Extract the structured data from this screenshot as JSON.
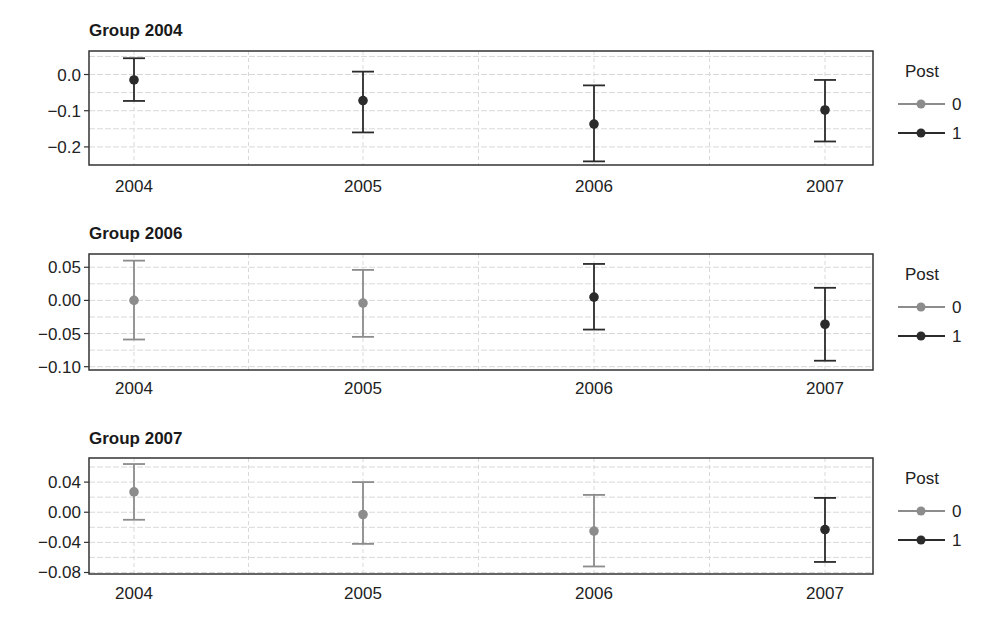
{
  "colors": {
    "post0": "#8c8c8c",
    "post1": "#2b2b2b",
    "frame": "#333333",
    "grid": "#d9d9d9"
  },
  "legend": {
    "title": "Post",
    "items": [
      {
        "label": "0"
      },
      {
        "label": "1"
      }
    ]
  },
  "chart_data": [
    {
      "type": "errorbar",
      "title": "Group 2004",
      "xlabel": "",
      "ylabel": "",
      "categories": [
        "2004",
        "2005",
        "2006",
        "2007"
      ],
      "yticks": [
        "0.0",
        "-0.1",
        "-0.2"
      ],
      "ylim": [
        -0.25,
        0.065
      ],
      "grid": true,
      "legend_position": "right",
      "series": [
        {
          "name": "1",
          "x": [
            "2004",
            "2005",
            "2006",
            "2007"
          ],
          "values": [
            -0.015,
            -0.072,
            -0.137,
            -0.098
          ],
          "lower": [
            -0.073,
            -0.16,
            -0.24,
            -0.185
          ],
          "upper": [
            0.045,
            0.008,
            -0.03,
            -0.015
          ]
        }
      ]
    },
    {
      "type": "errorbar",
      "title": "Group 2006",
      "xlabel": "",
      "ylabel": "",
      "categories": [
        "2004",
        "2005",
        "2006",
        "2007"
      ],
      "yticks": [
        "0.05",
        "0.00",
        "-0.05",
        "-0.10"
      ],
      "ylim": [
        -0.105,
        0.07
      ],
      "grid": true,
      "legend_position": "right",
      "series": [
        {
          "name": "0",
          "x": [
            "2004",
            "2005"
          ],
          "values": [
            0.0,
            -0.004
          ],
          "lower": [
            -0.059,
            -0.055
          ],
          "upper": [
            0.06,
            0.046
          ]
        },
        {
          "name": "1",
          "x": [
            "2006",
            "2007"
          ],
          "values": [
            0.005,
            -0.036
          ],
          "lower": [
            -0.044,
            -0.091
          ],
          "upper": [
            0.055,
            0.019
          ]
        }
      ]
    },
    {
      "type": "errorbar",
      "title": "Group 2007",
      "xlabel": "",
      "ylabel": "",
      "categories": [
        "2004",
        "2005",
        "2006",
        "2007"
      ],
      "yticks": [
        "0.04",
        "0.00",
        "-0.04",
        "-0.08"
      ],
      "ylim": [
        -0.082,
        0.072
      ],
      "grid": true,
      "legend_position": "right",
      "series": [
        {
          "name": "0",
          "x": [
            "2004",
            "2005",
            "2006"
          ],
          "values": [
            0.027,
            -0.003,
            -0.025
          ],
          "lower": [
            -0.01,
            -0.042,
            -0.072
          ],
          "upper": [
            0.064,
            0.04,
            0.023
          ]
        },
        {
          "name": "1",
          "x": [
            "2007"
          ],
          "values": [
            -0.023
          ],
          "lower": [
            -0.066
          ],
          "upper": [
            0.019
          ]
        }
      ]
    }
  ]
}
